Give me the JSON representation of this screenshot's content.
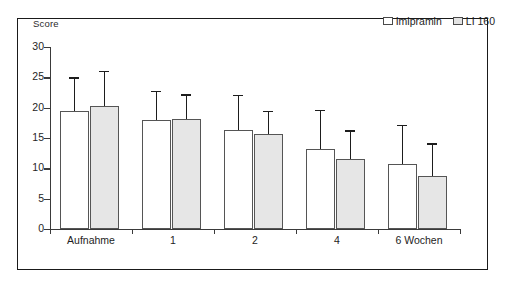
{
  "figure": {
    "axis_label_y": "Score"
  },
  "legend": {
    "position": "top-right",
    "entries": [
      {
        "label": "Imipramin",
        "swatch": "white-square-icon",
        "color": "#ffffff"
      },
      {
        "label": "LI 160",
        "swatch": "grey-square-icon",
        "color": "#e6e6e6"
      }
    ]
  },
  "chart_data": {
    "type": "bar",
    "title": "",
    "subtitle": "",
    "xlabel": "",
    "ylabel": "Score",
    "categories": [
      "Aufnahme",
      "1",
      "2",
      "4",
      "6 Wochen"
    ],
    "ylim": [
      0,
      30
    ],
    "yticks": [
      0,
      5,
      10,
      15,
      20,
      25,
      30
    ],
    "ytick_labels": [
      "0",
      "5",
      "10",
      "15",
      "20",
      "25",
      "30"
    ],
    "grid": false,
    "legend_position": "top-right",
    "error_bars": "upper-only",
    "series": [
      {
        "name": "Imipramin",
        "color": "#ffffff",
        "edge_color": "#555555",
        "values": [
          19.5,
          18.0,
          16.4,
          13.2,
          10.7
        ],
        "error_upper": [
          5.5,
          4.8,
          5.7,
          6.4,
          6.5
        ],
        "error_top_values": [
          25.0,
          22.8,
          22.1,
          19.6,
          17.2
        ]
      },
      {
        "name": "LI 160",
        "color": "#e6e6e6",
        "edge_color": "#555555",
        "values": [
          20.2,
          18.2,
          15.6,
          11.6,
          8.8
        ],
        "error_upper": [
          5.9,
          4.0,
          3.9,
          4.7,
          5.3
        ],
        "error_top_values": [
          26.1,
          22.2,
          19.5,
          16.3,
          14.1
        ]
      }
    ]
  }
}
